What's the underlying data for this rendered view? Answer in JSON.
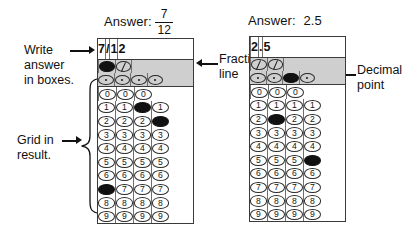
{
  "figure": {
    "background": "#ffffff",
    "ink": "#111111",
    "shaded_column_color": "#cfcfcf",
    "filled_bubble_color": "#111111"
  },
  "panels": [
    {
      "id": "fraction-panel",
      "answer_prefix": "Answer:",
      "answer_type": "fraction",
      "answer_numerator": "7",
      "answer_denominator": "12",
      "answer_text": "7/12",
      "columns": 4,
      "written_answer": [
        "7",
        "/",
        "1",
        "2"
      ],
      "fraction_row": [
        {
          "present": false,
          "filled": false
        },
        {
          "present": true,
          "filled": true
        },
        {
          "present": true,
          "filled": false
        },
        {
          "present": false,
          "filled": false
        }
      ],
      "decimal_row": [
        {
          "present": true,
          "filled": false
        },
        {
          "present": true,
          "filled": false
        },
        {
          "present": true,
          "filled": false
        },
        {
          "present": true,
          "filled": false
        }
      ],
      "zero_row": [
        {
          "present": false,
          "filled": false
        },
        {
          "present": true,
          "filled": false
        },
        {
          "present": true,
          "filled": false
        },
        {
          "present": true,
          "filled": false
        }
      ],
      "digits": [
        "1",
        "2",
        "3",
        "4",
        "5",
        "6",
        "7",
        "8",
        "9"
      ],
      "filled_digit_per_column": [
        "7",
        null,
        "1",
        "2"
      ]
    },
    {
      "id": "decimal-panel",
      "answer_prefix": "Answer:",
      "answer_type": "decimal",
      "answer_text": "2.5",
      "columns": 4,
      "written_answer": [
        "",
        "2",
        ".",
        "5"
      ],
      "fraction_row": [
        {
          "present": false,
          "filled": false
        },
        {
          "present": true,
          "filled": false
        },
        {
          "present": true,
          "filled": false
        },
        {
          "present": false,
          "filled": false
        }
      ],
      "decimal_row": [
        {
          "present": true,
          "filled": false
        },
        {
          "present": true,
          "filled": false
        },
        {
          "present": true,
          "filled": true
        },
        {
          "present": true,
          "filled": false
        }
      ],
      "zero_row": [
        {
          "present": false,
          "filled": false
        },
        {
          "present": true,
          "filled": false
        },
        {
          "present": true,
          "filled": false
        },
        {
          "present": true,
          "filled": false
        }
      ],
      "digits": [
        "1",
        "2",
        "3",
        "4",
        "5",
        "6",
        "7",
        "8",
        "9"
      ],
      "filled_digit_per_column": [
        null,
        "2",
        null,
        "5"
      ]
    }
  ],
  "annotations": {
    "write_answer": "Write\nanswer\nin boxes.",
    "write_answer_line1": "Write",
    "write_answer_line2": "answer",
    "write_answer_line3": "in boxes.",
    "grid_in_result_line1": "Grid in",
    "grid_in_result_line2": "result.",
    "fraction_line_line1": "Fraction",
    "fraction_line_line2": "line",
    "decimal_point_line1": "Decimal",
    "decimal_point_line2": "point"
  }
}
